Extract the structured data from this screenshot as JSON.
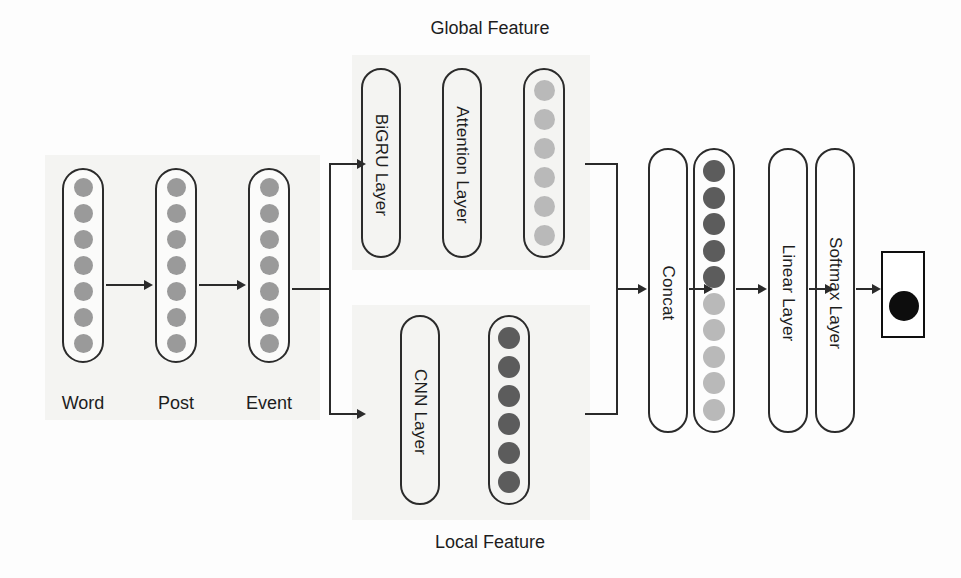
{
  "diagram": {
    "section_labels": {
      "global": "Global Feature",
      "local": "Local Feature"
    },
    "input_labels": [
      "Word",
      "Post",
      "Event"
    ],
    "layers": {
      "bigru": "BiGRU Layer",
      "attention": "Attention Layer",
      "cnn": "CNN Layer",
      "concat": "Concat",
      "linear": "Linear Layer",
      "softmax": "Softmax Layer"
    },
    "vectors": {
      "word": {
        "count": 7,
        "shade": "#9a9a9a"
      },
      "post": {
        "count": 7,
        "shade": "#9a9a9a"
      },
      "event": {
        "count": 7,
        "shade": "#9a9a9a"
      },
      "global_out": {
        "count": 6,
        "shade": "#b9b9b9"
      },
      "local_out": {
        "count": 6,
        "shade": "#5c5c5c"
      },
      "concat_out": {
        "count": 10,
        "shades": [
          "#5c5c5c",
          "#5c5c5c",
          "#5c5c5c",
          "#5c5c5c",
          "#5c5c5c",
          "#b9b9b9",
          "#b9b9b9",
          "#b9b9b9",
          "#b9b9b9",
          "#b9b9b9"
        ]
      },
      "prediction": {
        "count": 1,
        "shade": "#0d0d0d"
      }
    },
    "colors": {
      "stroke": "#2b2b2b",
      "text": "#1d1d1d",
      "panel": "#f4f4f2",
      "background": "#fdfdfd",
      "dot_mid": "#9a9a9a",
      "dot_light": "#b9b9b9",
      "dot_dark": "#5c5c5c",
      "dot_black": "#0d0d0d"
    }
  }
}
